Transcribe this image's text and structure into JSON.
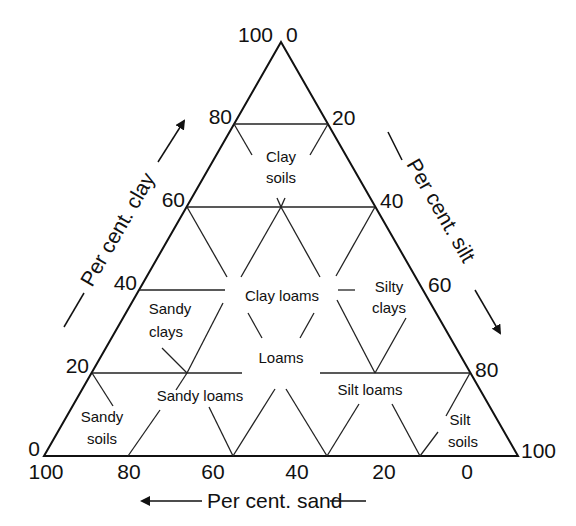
{
  "diagram": {
    "type": "soil-texture-triangle",
    "corners": {
      "top": [
        281,
        42
      ],
      "bottom_left": [
        44,
        456
      ],
      "bottom_right": [
        518,
        456
      ]
    },
    "axes": {
      "clay": {
        "label": "Per cent. clay",
        "ticks": [
          "100",
          "80",
          "60",
          "40",
          "20",
          "0"
        ]
      },
      "silt": {
        "label": "Per cent. silt",
        "ticks": [
          "0",
          "20",
          "40",
          "60",
          "80",
          "100"
        ]
      },
      "sand": {
        "label": "Per cent. sand",
        "ticks": [
          "100",
          "80",
          "60",
          "40",
          "20",
          "0"
        ]
      }
    },
    "regions": {
      "clay_soils": [
        "Clay",
        "soils"
      ],
      "clay_loams": "Clay loams",
      "sandy_clays": [
        "Sandy",
        "clays"
      ],
      "silty_clays": [
        "Silty",
        "clays"
      ],
      "loams": "Loams",
      "sandy_loams": "Sandy loams",
      "silt_loams": "Silt loams",
      "sandy_soils": [
        "Sandy",
        "soils"
      ],
      "silt_soils": [
        "Silt",
        "soils"
      ]
    }
  }
}
